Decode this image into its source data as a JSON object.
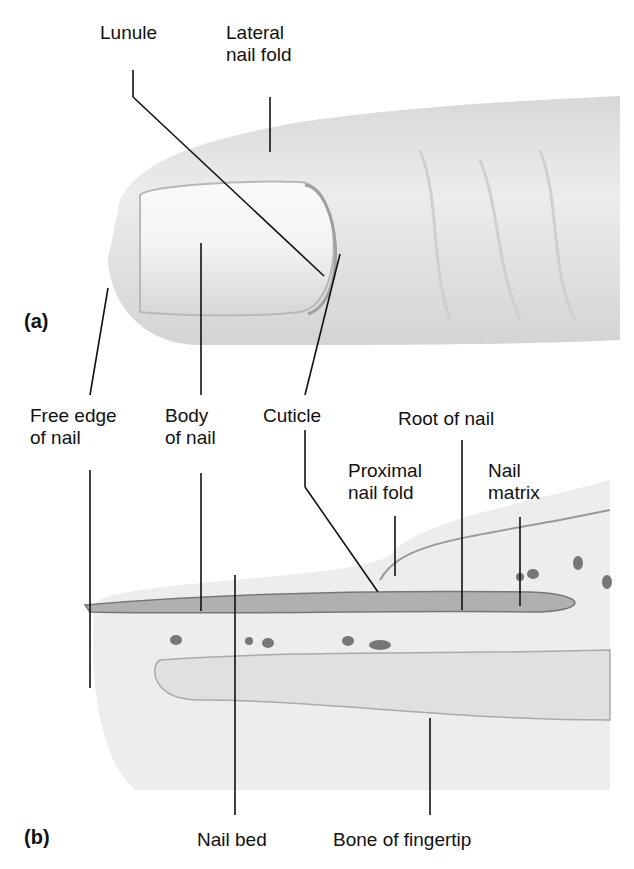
{
  "figure": {
    "panel_a": {
      "label": "(a)",
      "labels": {
        "lunule": "Lunule",
        "lateral_nail_fold": "Lateral\nnail fold"
      }
    },
    "shared_labels": {
      "free_edge": "Free edge\nof nail",
      "body_of_nail": "Body\nof nail",
      "cuticle": "Cuticle",
      "root_of_nail": "Root of nail"
    },
    "panel_b": {
      "label": "(b)",
      "labels": {
        "proximal_nail_fold": "Proximal\nnail fold",
        "nail_matrix": "Nail\nmatrix",
        "nail_bed": "Nail bed",
        "bone_of_fingertip": "Bone of fingertip"
      }
    }
  }
}
